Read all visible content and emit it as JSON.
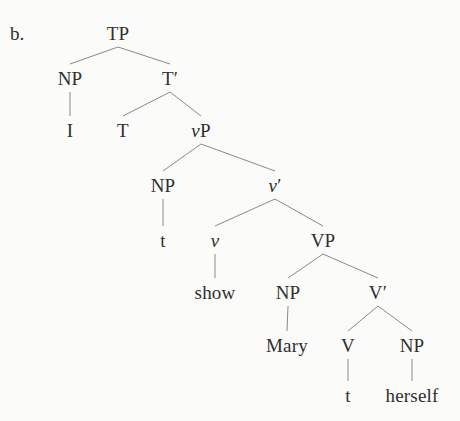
{
  "figure": {
    "item_label": "b.",
    "caption": "",
    "background_color": "#fbfbf9",
    "line_color": "#8a8a8a",
    "text_color": "#2f2f2f"
  },
  "tree": {
    "type": "syntactic-tree",
    "sentence": "I show Mary herself",
    "nodes": [
      {
        "id": "TP",
        "text": "TP",
        "style": "roman",
        "x": 118,
        "y": 33
      },
      {
        "id": "NP1",
        "text": "NP",
        "style": "roman",
        "x": 70,
        "y": 78
      },
      {
        "id": "Tbar",
        "text": "T′",
        "style": "roman",
        "x": 170,
        "y": 78
      },
      {
        "id": "I",
        "text": "I",
        "style": "roman",
        "x": 70,
        "y": 130
      },
      {
        "id": "T",
        "text": "T",
        "style": "roman",
        "x": 123,
        "y": 130
      },
      {
        "id": "vP",
        "text": "vP",
        "style": "italic-first",
        "x": 201,
        "y": 130
      },
      {
        "id": "NP2",
        "text": "NP",
        "style": "roman",
        "x": 163,
        "y": 185
      },
      {
        "id": "vbar",
        "text": "v′",
        "style": "italic-first",
        "x": 275,
        "y": 185
      },
      {
        "id": "t1",
        "text": "t",
        "style": "roman",
        "x": 163,
        "y": 240
      },
      {
        "id": "v",
        "text": "v",
        "style": "italic",
        "x": 215,
        "y": 240
      },
      {
        "id": "VP",
        "text": "VP",
        "style": "roman",
        "x": 323,
        "y": 240
      },
      {
        "id": "show",
        "text": "show",
        "style": "roman",
        "x": 215,
        "y": 292
      },
      {
        "id": "NP3",
        "text": "NP",
        "style": "roman",
        "x": 288,
        "y": 292
      },
      {
        "id": "Vbar",
        "text": "V′",
        "style": "roman",
        "x": 378,
        "y": 292
      },
      {
        "id": "Mary",
        "text": "Mary",
        "style": "roman",
        "x": 287,
        "y": 345
      },
      {
        "id": "V",
        "text": "V",
        "style": "roman",
        "x": 348,
        "y": 345
      },
      {
        "id": "NP4",
        "text": "NP",
        "style": "roman",
        "x": 412,
        "y": 345
      },
      {
        "id": "t2",
        "text": "t",
        "style": "roman",
        "x": 348,
        "y": 395
      },
      {
        "id": "herself",
        "text": "herself",
        "style": "roman",
        "x": 412,
        "y": 395
      }
    ],
    "edges": [
      {
        "from": "TP",
        "to": "NP1",
        "kind": "branch"
      },
      {
        "from": "TP",
        "to": "Tbar",
        "kind": "branch"
      },
      {
        "from": "NP1",
        "to": "I",
        "kind": "stem"
      },
      {
        "from": "Tbar",
        "to": "T",
        "kind": "branch"
      },
      {
        "from": "Tbar",
        "to": "vP",
        "kind": "branch"
      },
      {
        "from": "vP",
        "to": "NP2",
        "kind": "branch"
      },
      {
        "from": "vP",
        "to": "vbar",
        "kind": "branch"
      },
      {
        "from": "NP2",
        "to": "t1",
        "kind": "stem"
      },
      {
        "from": "vbar",
        "to": "v",
        "kind": "branch"
      },
      {
        "from": "vbar",
        "to": "VP",
        "kind": "branch"
      },
      {
        "from": "v",
        "to": "show",
        "kind": "stem"
      },
      {
        "from": "VP",
        "to": "NP3",
        "kind": "branch"
      },
      {
        "from": "VP",
        "to": "Vbar",
        "kind": "branch"
      },
      {
        "from": "NP3",
        "to": "Mary",
        "kind": "stem"
      },
      {
        "from": "Vbar",
        "to": "V",
        "kind": "branch"
      },
      {
        "from": "Vbar",
        "to": "NP4",
        "kind": "branch"
      },
      {
        "from": "V",
        "to": "t2",
        "kind": "stem"
      },
      {
        "from": "NP4",
        "to": "herself",
        "kind": "stem"
      }
    ]
  }
}
